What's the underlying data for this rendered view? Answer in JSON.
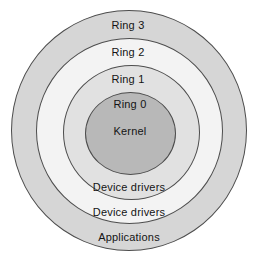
{
  "background": "#ffffff",
  "line_color": "#4d4d4d",
  "text_color": "#141414",
  "diagram": {
    "type": "concentric-rings",
    "rings": [
      {
        "label": "Ring 3",
        "region_label": "Applications",
        "fill": "#d6d6d6"
      },
      {
        "label": "Ring 2",
        "region_label": "Device drivers",
        "fill": "#f3f3f3"
      },
      {
        "label": "Ring 1",
        "region_label": "Device drivers",
        "fill": "#e1e1e1"
      },
      {
        "label": "Ring 0",
        "region_label": "Kernel",
        "fill": "#b8b8b8"
      }
    ]
  }
}
